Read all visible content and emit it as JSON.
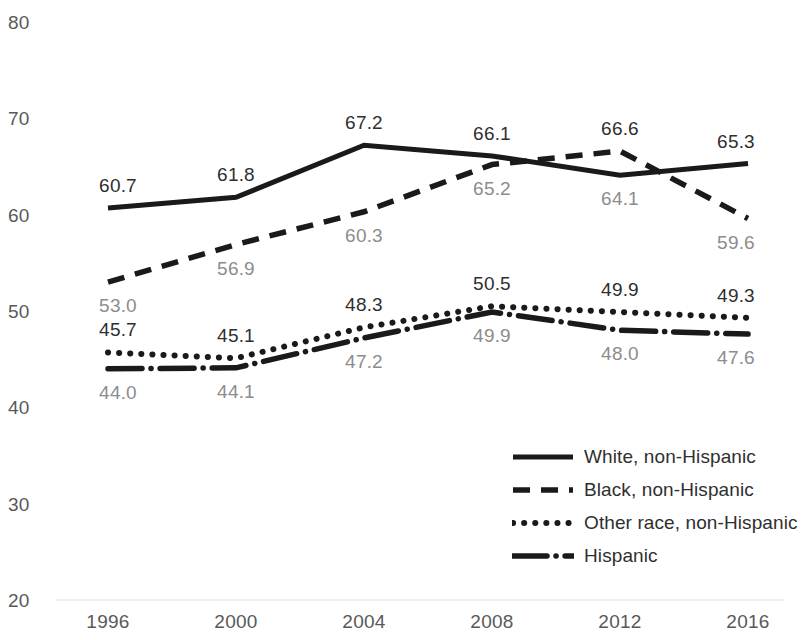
{
  "chart_data": {
    "type": "line",
    "title": "",
    "xlabel": "",
    "ylabel": "",
    "x": [
      1996,
      2000,
      2004,
      2008,
      2012,
      2016
    ],
    "categories": [
      "1996",
      "2000",
      "2004",
      "2008",
      "2012",
      "2016"
    ],
    "ylim": [
      20,
      80
    ],
    "yticks": [
      20,
      30,
      40,
      50,
      60,
      70,
      80
    ],
    "ytick_labels": [
      "20",
      "30",
      "40",
      "50",
      "60",
      "70",
      "80"
    ],
    "xtick_labels": [
      "1996",
      "2000",
      "2004",
      "2008",
      "2012",
      "2016"
    ],
    "grid": false,
    "legend_position": "inside-bottom-right",
    "series": [
      {
        "name": "White, non-Hispanic",
        "style": "solid",
        "color": "#1a1a1a",
        "values": [
          60.7,
          61.8,
          67.2,
          66.1,
          64.1,
          65.3
        ],
        "labels": [
          "60.7",
          "61.8",
          "67.2",
          "66.1",
          "64.1",
          "65.3"
        ],
        "label_side": [
          "above",
          "above",
          "above",
          "above",
          "below",
          "above"
        ]
      },
      {
        "name": "Black, non-Hispanic",
        "style": "dashed",
        "color": "#1a1a1a",
        "values": [
          53.0,
          56.9,
          60.3,
          65.2,
          66.6,
          59.6
        ],
        "labels": [
          "53.0",
          "56.9",
          "60.3",
          "65.2",
          "66.6",
          "59.6"
        ],
        "label_side": [
          "below",
          "below",
          "below",
          "below",
          "above",
          "below"
        ]
      },
      {
        "name": "Other race, non-Hispanic",
        "style": "dotted",
        "color": "#1a1a1a",
        "values": [
          45.7,
          45.1,
          48.3,
          50.5,
          49.9,
          49.3
        ],
        "labels": [
          "45.7",
          "45.1",
          "48.3",
          "50.5",
          "49.9",
          "49.3"
        ],
        "label_side": [
          "above",
          "above",
          "above",
          "above",
          "above",
          "above"
        ]
      },
      {
        "name": "Hispanic",
        "style": "longdash",
        "color": "#1a1a1a",
        "values": [
          44.0,
          44.1,
          47.2,
          49.9,
          48.0,
          47.6
        ],
        "labels": [
          "44.0",
          "44.1",
          "47.2",
          "49.9",
          "48.0",
          "47.6"
        ],
        "label_side": [
          "below",
          "below",
          "below",
          "below",
          "below",
          "below"
        ]
      }
    ]
  },
  "legend": {
    "items": [
      {
        "label": "White, non-Hispanic",
        "style": "solid"
      },
      {
        "label": "Black, non-Hispanic",
        "style": "dashed"
      },
      {
        "label": "Other race, non-Hispanic",
        "style": "dotted"
      },
      {
        "label": "Hispanic",
        "style": "longdash"
      }
    ]
  },
  "axis_colors": {
    "tick_text": "#595959",
    "label_above": "#2f2f2f",
    "label_below": "#8c8c8c",
    "baseline": "#efefef",
    "line": "#1a1a1a"
  }
}
